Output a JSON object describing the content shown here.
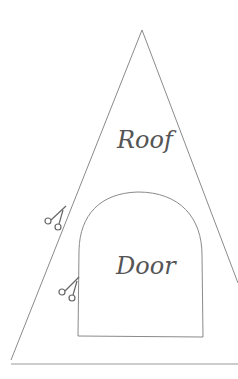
{
  "diagram": {
    "shapes": [
      {
        "id": "roof",
        "label": "Roof"
      },
      {
        "id": "door",
        "label": "Door"
      }
    ],
    "cut_marks": [
      {
        "icon": "scissors-icon",
        "position": "roof-edge"
      },
      {
        "icon": "scissors-icon",
        "position": "door-edge"
      }
    ],
    "stroke_color": "#8a8a8a"
  }
}
